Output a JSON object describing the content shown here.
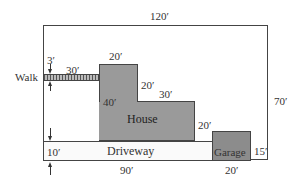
{
  "diagram": {
    "labels": {
      "lot_width": "120′",
      "lot_height": "70′",
      "walk": "Walk",
      "walk_width": "3′",
      "walk_length": "30′",
      "house_top": "20′",
      "house_step_vertical": "20′",
      "house_step_horizontal": "30′",
      "house_left": "40′",
      "house_right": "20′",
      "house": "House",
      "driveway": "Driveway",
      "driveway_width": "10′",
      "driveway_length": "90′",
      "garage": "Garage",
      "garage_width": "20′",
      "garage_height": "15′"
    },
    "colors": {
      "house_fill": "#9a9a9a",
      "garage_fill": "#8c8c8c",
      "outline": "#444444"
    }
  }
}
